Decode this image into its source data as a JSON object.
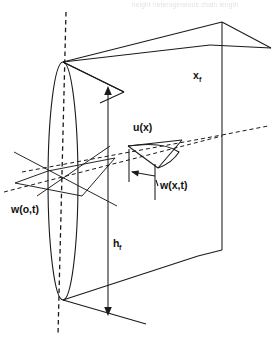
{
  "figure": {
    "kind": "engineering-diagram",
    "background_color": "#ffffff",
    "line_color": "#1a1a1a",
    "width": 276,
    "height": 339
  },
  "header": {
    "cropped_text": "height   heterogeneous   chain   length"
  },
  "labels": {
    "x_f": {
      "base": "x",
      "subscript": "f",
      "x": 193,
      "y": 79
    },
    "h_f": {
      "base": "h",
      "subscript": "f",
      "x": 113,
      "y": 247
    },
    "w_o_t": {
      "text": "w(o,t)",
      "x": 11,
      "y": 213
    },
    "u_x": {
      "text": "u(x)",
      "x": 133,
      "y": 131
    },
    "w_x_t": {
      "text": "w(x,t)",
      "x": 160,
      "y": 189
    }
  },
  "annotations": {
    "dimension_arrows": [
      {
        "name": "h_f",
        "orientation": "vertical",
        "double_headed": true
      },
      {
        "name": "x_f",
        "orientation": "oblique",
        "single_headed": true
      },
      {
        "name": "w_x_t",
        "orientation": "horizontal",
        "single_headed": true
      }
    ],
    "axis": {
      "name": "centerline",
      "style": "dashed",
      "orientation": "vertical"
    }
  },
  "geometry": {
    "ellipse": {
      "cx": 63,
      "cy": 181,
      "rx": 15,
      "ry": 119,
      "note": "elliptical cross-section of the fin base"
    },
    "plate": {
      "note": "vertical rectangular plate drawn in oblique projection"
    },
    "mid_plane": {
      "note": "horizontal reference plane slicing through the plate"
    }
  }
}
